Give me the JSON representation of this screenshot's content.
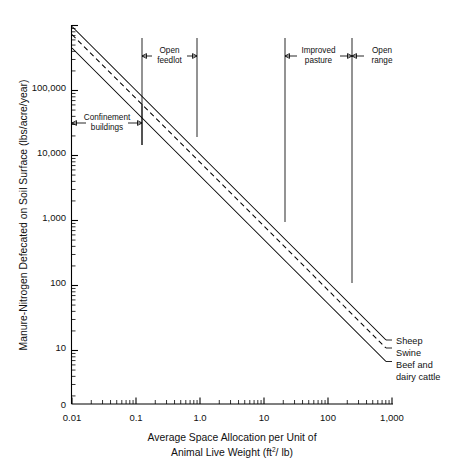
{
  "chart_data": {
    "type": "line",
    "title": "",
    "xlabel": "Average Space Allocation per Unit of Animal Live Weight (ft2/ lb)",
    "xlabel_line1": "Average Space Allocation per Unit of",
    "xlabel_line2_a": "Animal Live Weight (ft",
    "xlabel_line2_sup": "2",
    "xlabel_line2_b": "/ lb)",
    "ylabel": "Manure-Nitrogen Defecated on Soil Surface (lbs/acre/year)",
    "xscale": "log",
    "yscale": "log",
    "xlim": [
      0.01,
      1000
    ],
    "ylim": [
      1,
      1000000
    ],
    "grid": false,
    "legend_position": "right-inline",
    "xticks": [
      "0.01",
      "0.1",
      "1.0",
      "10",
      "100",
      "1,000"
    ],
    "xtick_values": [
      0.01,
      0.1,
      1,
      10,
      100,
      1000
    ],
    "yticks": [
      "100,000",
      "10,000",
      "1,000",
      "100",
      "10",
      "0"
    ],
    "ytick_values": [
      100000,
      10000,
      1000,
      100,
      10,
      0
    ],
    "origin_label": "0",
    "series": [
      {
        "name": "Sheep",
        "style": "solid",
        "x": [
          0.01,
          1000
        ],
        "y": [
          720000,
          19
        ],
        "note": "uppermost line"
      },
      {
        "name": "Swine",
        "style": "dashed",
        "x": [
          0.01,
          1000
        ],
        "y": [
          530000,
          13
        ],
        "note": "middle dashed line"
      },
      {
        "name": "Beef and dairy cattle",
        "style": "solid",
        "x": [
          0.01,
          1000
        ],
        "y": [
          330000,
          8
        ],
        "note": "lowermost line"
      }
    ],
    "annotations": [
      {
        "label": "Confinement buildings",
        "label_line1": "Confinement",
        "label_line2": "buildings",
        "x_start": 0.01,
        "x_end": 0.1,
        "arrow": "double"
      },
      {
        "label": "Open feedlot",
        "label_line1": "Open",
        "label_line2": "feedlot",
        "x_start": 0.1,
        "x_end": 0.8,
        "arrow": "double"
      },
      {
        "label": "Improved pasture",
        "label_line1": "Improved",
        "label_line2": "pasture",
        "x_start": 20,
        "x_end": 300,
        "arrow": "double"
      },
      {
        "label": "Open range",
        "label_line1": "Open",
        "label_line2": "range",
        "x_start": 300,
        "x_end": 1000,
        "arrow": "left"
      }
    ],
    "legend_entries": [
      {
        "label": "Sheep"
      },
      {
        "label": "Swine"
      },
      {
        "label_line1": "Beef and",
        "label_line2": "dairy cattle"
      }
    ]
  },
  "colors": {
    "background": "#ffffff",
    "ink": "#111111",
    "axis": "#000000"
  }
}
